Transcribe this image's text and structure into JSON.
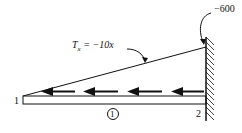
{
  "diagram": {
    "type": "torsion-bar-distributed-torque",
    "torque_expression": "T_x = −10x",
    "torque_symbol": "T",
    "torque_subscript": "x",
    "torque_rhs": "= −10x",
    "end_reaction": "−600",
    "node_left": "1",
    "node_right": "2",
    "element_label": "1",
    "colors": {
      "line": "#111111",
      "background": "#ffffff"
    }
  }
}
